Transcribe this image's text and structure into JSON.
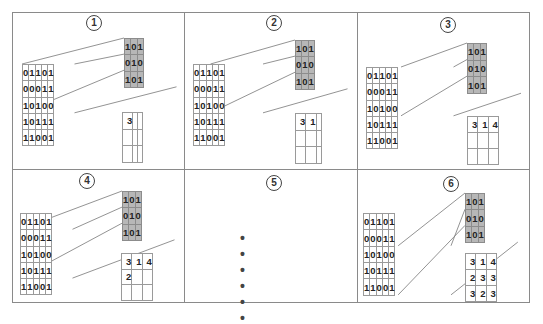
{
  "colors": {
    "kernel_fill": "#b7b7b7",
    "border": "#8a8a8a",
    "text": "#222222"
  },
  "input_matrix": [
    [
      "0",
      "1",
      "1",
      "0",
      "1"
    ],
    [
      "0",
      "0",
      "0",
      "1",
      "1"
    ],
    [
      "1",
      "0",
      "1",
      "0",
      "0"
    ],
    [
      "1",
      "0",
      "1",
      "1",
      "1"
    ],
    [
      "1",
      "1",
      "0",
      "0",
      "1"
    ]
  ],
  "kernel_matrix": [
    [
      "1",
      "0",
      "1"
    ],
    [
      "0",
      "1",
      "0"
    ],
    [
      "1",
      "0",
      "1"
    ]
  ],
  "panels": [
    {
      "label": "①",
      "step": 1,
      "window_row": 0,
      "window_col": 0,
      "output": [
        [
          "3",
          "",
          ""
        ],
        [
          "",
          "",
          ""
        ],
        [
          "",
          "",
          ""
        ]
      ]
    },
    {
      "label": "②",
      "step": 2,
      "window_row": 0,
      "window_col": 1,
      "output": [
        [
          "3",
          "1",
          ""
        ],
        [
          "",
          "",
          ""
        ],
        [
          "",
          "",
          ""
        ]
      ]
    },
    {
      "label": "③",
      "step": 3,
      "window_row": 0,
      "window_col": 2,
      "output": [
        [
          "3",
          "1",
          "4"
        ],
        [
          "",
          "",
          ""
        ],
        [
          "",
          "",
          ""
        ]
      ]
    },
    {
      "label": "④",
      "step": 4,
      "window_row": 1,
      "window_col": 0,
      "output": [
        [
          "3",
          "1",
          "4"
        ],
        [
          "2",
          "",
          ""
        ],
        [
          "",
          "",
          ""
        ]
      ]
    },
    {
      "label": "⑤",
      "step": 5,
      "ellipsis": "• • • • • •"
    },
    {
      "label": "⑥",
      "step": 6,
      "window_row": 2,
      "window_col": 2,
      "output": [
        [
          "3",
          "1",
          "4"
        ],
        [
          "2",
          "3",
          "3"
        ],
        [
          "3",
          "2",
          "3"
        ]
      ]
    }
  ]
}
